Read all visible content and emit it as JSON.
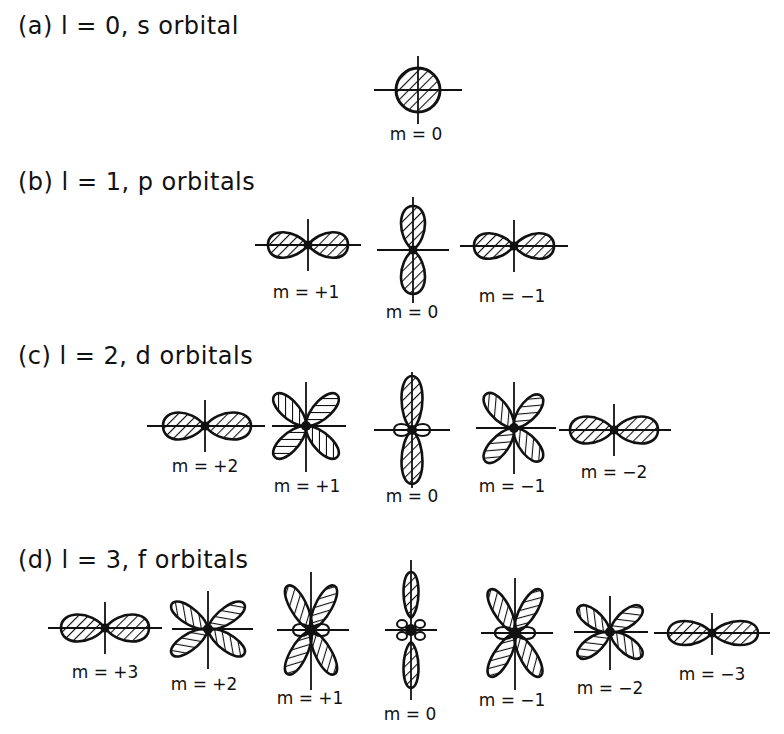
{
  "sections": [
    {
      "heading": "(a)  l = 0,  s orbital",
      "l": 0,
      "type": "s",
      "orbitals": [
        {
          "m_label": "m = 0"
        }
      ]
    },
    {
      "heading": "(b)  l = 1,  p orbitals",
      "l": 1,
      "type": "p",
      "orbitals": [
        {
          "m_label": "m = +1"
        },
        {
          "m_label": "m = 0"
        },
        {
          "m_label": "m = −1"
        }
      ]
    },
    {
      "heading": "(c)  l = 2,  d orbitals",
      "l": 2,
      "type": "d",
      "orbitals": [
        {
          "m_label": "m = +2"
        },
        {
          "m_label": "m = +1"
        },
        {
          "m_label": "m = 0"
        },
        {
          "m_label": "m = −1"
        },
        {
          "m_label": "m = −2"
        }
      ]
    },
    {
      "heading": "(d)  l = 3,  f orbitals",
      "l": 3,
      "type": "f",
      "orbitals": [
        {
          "m_label": "m = +3"
        },
        {
          "m_label": "m = +2"
        },
        {
          "m_label": "m = +1"
        },
        {
          "m_label": "m = 0"
        },
        {
          "m_label": "m = −1"
        },
        {
          "m_label": "m = −2"
        },
        {
          "m_label": "m = −3"
        }
      ]
    }
  ],
  "style": {
    "ink": "#111111",
    "background": "#ffffff"
  }
}
